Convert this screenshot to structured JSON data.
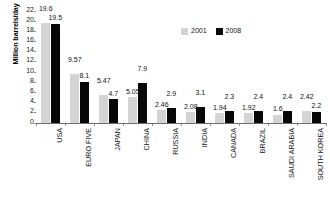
{
  "chart_data": {
    "type": "bar",
    "title": "",
    "xlabel": "",
    "ylabel": "Million barrels/day",
    "ylim": [
      0,
      22
    ],
    "ytick_step": 2,
    "yticks": [
      "22",
      "20",
      "18",
      "16",
      "14",
      "12",
      "10",
      "8",
      "6",
      "4",
      "2",
      "0"
    ],
    "grid": false,
    "legend_position": "top-right",
    "categories": [
      "USA",
      "EURO FIVE",
      "JAPAN",
      "CHINA",
      "RUSSIA",
      "INDIA",
      "CANADA",
      "BRAZIL",
      "SAUDI ARABIA",
      "SOUTH KOREA"
    ],
    "series": [
      {
        "name": "2001",
        "color": "#d4d4d4",
        "values": [
          19.6,
          9.57,
          5.47,
          5.05,
          2.46,
          2.08,
          1.94,
          1.92,
          1.6,
          2.42
        ],
        "labels": [
          "19.6",
          "9.57",
          "5.47",
          "5.05",
          "2.46",
          "2.08",
          "1.94",
          "1.92",
          "1.6",
          "2.42"
        ]
      },
      {
        "name": "2008",
        "color": "#080808",
        "values": [
          19.5,
          8.1,
          4.7,
          7.9,
          2.9,
          3.1,
          2.3,
          2.4,
          2.4,
          2.2
        ],
        "labels": [
          "19.5",
          "8.1",
          "4.7",
          "7.9",
          "2.9",
          "3.1",
          "2.3",
          "2.4",
          "2.4",
          "2.2"
        ]
      }
    ]
  },
  "legend": {
    "items": [
      {
        "label": "2001",
        "swatch": "legend-swatch-2001"
      },
      {
        "label": "2008",
        "swatch": "legend-swatch-2008"
      }
    ]
  },
  "colors": {
    "series_2001": "#d4d4d4",
    "series_2008": "#080808",
    "axis": "#6e6e6e",
    "text": "#111111",
    "background": "#ffffff"
  }
}
